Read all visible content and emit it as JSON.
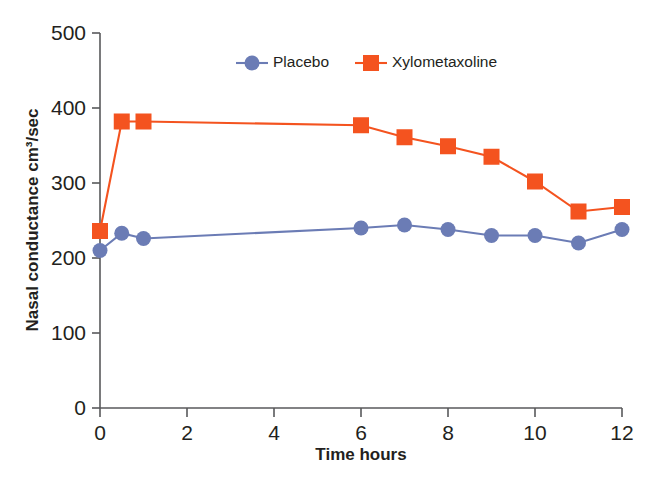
{
  "chart_data": {
    "type": "line",
    "title": "",
    "xlabel": "Time hours",
    "ylabel": "Nasal conductance cm³/sec",
    "xlim": [
      0,
      12
    ],
    "ylim": [
      0,
      500
    ],
    "xticks": [
      0,
      2,
      4,
      6,
      8,
      10,
      12
    ],
    "yticks": [
      0,
      100,
      200,
      300,
      400,
      500
    ],
    "xtick_labels": [
      "0",
      "2",
      "4",
      "6",
      "8",
      "10",
      "12"
    ],
    "ytick_labels": [
      "0",
      "100",
      "200",
      "300",
      "400",
      "500"
    ],
    "grid": false,
    "legend_position": "top-center",
    "series": [
      {
        "name": "Placebo",
        "color": "#6b7cb5",
        "marker": "circle",
        "x": [
          0,
          0.5,
          1,
          6,
          7,
          8,
          9,
          10,
          11,
          12
        ],
        "values": [
          210,
          233,
          226,
          240,
          244,
          238,
          230,
          230,
          220,
          238
        ]
      },
      {
        "name": "Xylometaxoline",
        "color": "#f4531f",
        "marker": "square",
        "x": [
          0,
          0.5,
          1,
          6,
          7,
          8,
          9,
          10,
          11,
          12
        ],
        "values": [
          236,
          382,
          382,
          377,
          361,
          349,
          335,
          302,
          262,
          268
        ]
      }
    ]
  },
  "legend": {
    "items": [
      {
        "label": "Placebo",
        "color": "#6b7cb5",
        "marker": "circle"
      },
      {
        "label": "Xylometaxoline",
        "color": "#f4531f",
        "marker": "square"
      }
    ]
  },
  "axes": {
    "x_title": "Time hours",
    "y_title": "Nasal conductance cm³/sec"
  },
  "colors": {
    "placebo": "#6b7cb5",
    "xylometaxoline": "#f4531f",
    "axis": "#58595b",
    "text": "#231f20",
    "background": "#ffffff"
  }
}
